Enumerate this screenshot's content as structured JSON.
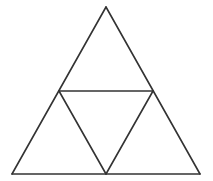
{
  "diagram": {
    "title": "",
    "type": "subdivided-equilateral-triangle",
    "stroke_color": "#333333",
    "background": "#ffffff",
    "stroke_width": 1.6,
    "vertices": {
      "apex": [
        106,
        7
      ],
      "bottom_left": [
        12,
        174
      ],
      "bottom_right": [
        200,
        174
      ],
      "mid_left": [
        59,
        91
      ],
      "mid_right": [
        153,
        91
      ],
      "mid_bottom": [
        106,
        174
      ]
    },
    "segments": [
      {
        "name": "outer-left-edge",
        "from": "apex",
        "to": "bottom_left"
      },
      {
        "name": "outer-right-edge",
        "from": "apex",
        "to": "bottom_right"
      },
      {
        "name": "outer-base-edge",
        "from": "bottom_left",
        "to": "bottom_right"
      },
      {
        "name": "inner-top-edge",
        "from": "mid_left",
        "to": "mid_right"
      },
      {
        "name": "inner-left-edge",
        "from": "mid_left",
        "to": "mid_bottom"
      },
      {
        "name": "inner-right-edge",
        "from": "mid_right",
        "to": "mid_bottom"
      }
    ]
  }
}
